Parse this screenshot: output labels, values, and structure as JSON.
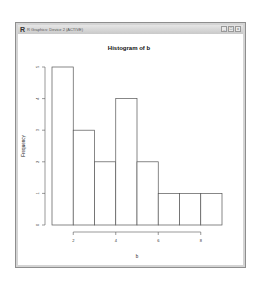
{
  "window": {
    "app_icon": "R",
    "title": "R Graphics: Device 2 (ACTIVE)",
    "controls": [
      {
        "name": "minimize-button",
        "glyph": "_"
      },
      {
        "name": "maximize-button",
        "glyph": "□"
      },
      {
        "name": "close-button",
        "glyph": "x"
      }
    ]
  },
  "chart_data": {
    "type": "bar",
    "title": "Histogram of b",
    "xlabel": "b",
    "ylabel": "Frequency",
    "bin_edges": [
      1,
      2,
      3,
      4,
      5,
      6,
      7,
      8,
      9
    ],
    "categories": [
      "1-2",
      "2-3",
      "3-4",
      "4-5",
      "5-6",
      "6-7",
      "7-8",
      "8-9"
    ],
    "values": [
      5,
      3,
      2,
      4,
      2,
      1,
      1,
      1
    ],
    "x_ticks": [
      "2",
      "4",
      "6",
      "8"
    ],
    "y_ticks": [
      "0",
      "1",
      "2",
      "3",
      "4",
      "5"
    ],
    "xlim": [
      1,
      9
    ],
    "ylim": [
      0,
      5
    ],
    "grid": false,
    "bar_fill": "#ffffff",
    "bar_stroke": "#555555"
  }
}
